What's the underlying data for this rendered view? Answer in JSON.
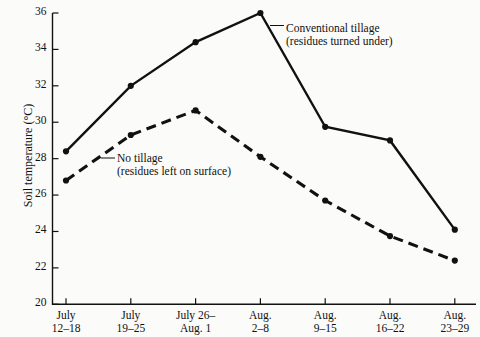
{
  "chart_data": {
    "type": "line",
    "title": "",
    "xlabel": "",
    "ylabel": "Soil temperature (°C)",
    "ylim": [
      20,
      36
    ],
    "ytick_step": 2,
    "yticks": [
      "20",
      "22",
      "24",
      "26",
      "28",
      "30",
      "32",
      "34",
      "36"
    ],
    "grid": false,
    "legend_position": "inline-annotations",
    "categories": [
      "July 12–18",
      "July 19–25",
      "July 26– Aug. 1",
      "Aug. 2–8",
      "Aug. 9–15",
      "Aug. 16–22",
      "Aug. 23–29"
    ],
    "xtick_lines": [
      [
        "July",
        "12–18"
      ],
      [
        "July",
        "19–25"
      ],
      [
        "July 26–",
        "Aug. 1"
      ],
      [
        "Aug.",
        "2–8"
      ],
      [
        "Aug.",
        "9–15"
      ],
      [
        "Aug.",
        "16–22"
      ],
      [
        "Aug.",
        "23–29"
      ]
    ],
    "series": [
      {
        "name": "Conventional tillage (residues turned under)",
        "style": "solid",
        "color": "#111111",
        "marker": "circle",
        "values": [
          28.4,
          32.0,
          34.4,
          36.0,
          29.75,
          29.0,
          24.1
        ]
      },
      {
        "name": "No tillage (residues left on surface)",
        "style": "dashed",
        "color": "#111111",
        "marker": "circle",
        "values": [
          26.8,
          29.3,
          30.65,
          28.1,
          25.7,
          23.75,
          22.4
        ]
      }
    ],
    "annotations": [
      {
        "id": "conventional",
        "line1": "Conventional tillage",
        "line2": "(residues turned under)"
      },
      {
        "id": "notillage",
        "line1": "No tillage",
        "line2": "(residues left on surface)"
      }
    ]
  }
}
